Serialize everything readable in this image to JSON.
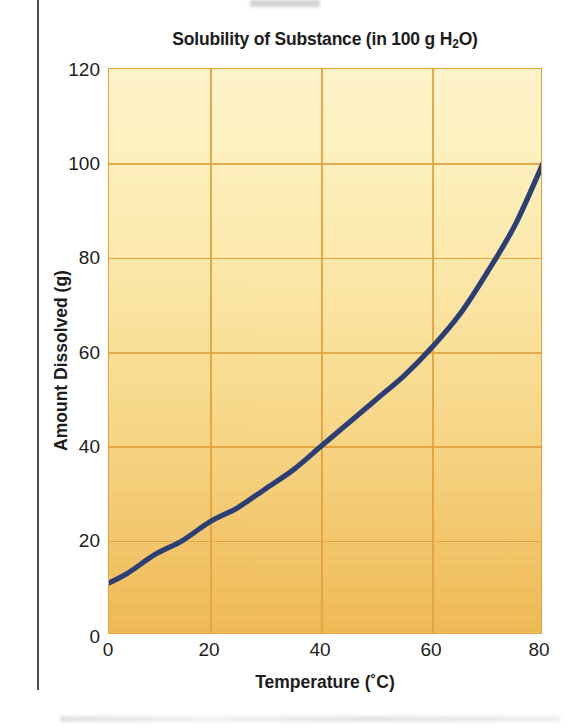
{
  "chart_data": {
    "type": "line",
    "title": "Solubility of Substance (in 100 g H",
    "title_sub": "2",
    "title_tail": "O)",
    "title_full": "Solubility of Substance (in 100 g H2O)",
    "xlabel": "Temperature (˚C)",
    "ylabel": "Amount Dissolved (g)",
    "xlim": [
      0,
      80
    ],
    "ylim": [
      0,
      120
    ],
    "xticks": [
      "0",
      "20",
      "40",
      "60",
      "80"
    ],
    "xtick_values": [
      0,
      20,
      40,
      60,
      80
    ],
    "yticks": [
      "0",
      "20",
      "40",
      "60",
      "80",
      "100",
      "120"
    ],
    "ytick_values": [
      0,
      20,
      40,
      60,
      80,
      100,
      120
    ],
    "grid": true,
    "legend": "none",
    "series": [
      {
        "name": "Solubility",
        "color": "#2b3f76",
        "x": [
          0,
          5,
          10,
          15,
          20,
          25,
          30,
          35,
          40,
          45,
          50,
          55,
          60,
          65,
          70,
          75,
          80
        ],
        "values": [
          10,
          13,
          17,
          20,
          24,
          27,
          31,
          35,
          40,
          45,
          50,
          55,
          61,
          68,
          77,
          87,
          100
        ]
      }
    ],
    "colors": {
      "line": "#2b3f76",
      "grid": "#e3a33f",
      "plot_top": "#fdf2c4",
      "plot_bottom": "#edb144",
      "text": "#1c1c1c"
    }
  }
}
